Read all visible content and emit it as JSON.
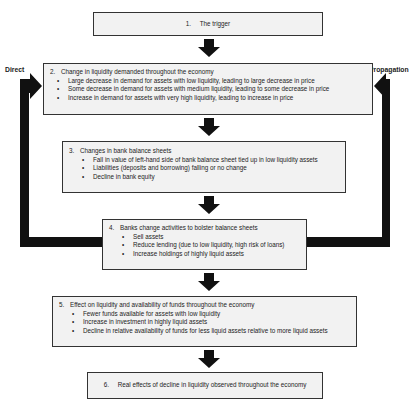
{
  "diagram": {
    "type": "flowchart",
    "side_labels": {
      "left": "Direct",
      "right": "Propagation"
    },
    "steps": [
      {
        "number": "1.",
        "title": "The trigger",
        "bullets": []
      },
      {
        "number": "2.",
        "title": "Change in liquidity demanded throughout the economy",
        "bullets": [
          "Large decrease in demand for assets with low liquidity, leading to large decrease in price",
          "Some decrease in demand for assets with medium liquidity, leading to some decrease in price",
          "Increase in demand for assets with very high liquidity, leading to increase in price"
        ]
      },
      {
        "number": "3.",
        "title": "Changes in bank balance sheets",
        "bullets": [
          "Fall in value of left-hand side of bank balance sheet tied up in low liquidity assets",
          "Liabilities (deposits and borrowing) falling or no change",
          "Decline in bank equity"
        ]
      },
      {
        "number": "4.",
        "title": "Banks change activities to bolster balance sheets",
        "bullets": [
          "Sell assets",
          "Reduce lending (due to low liquidity, high risk of loans)",
          "Increase holdings of highly liquid assets"
        ]
      },
      {
        "number": "5.",
        "title": "Effect on liquidity and availability of funds throughout the economy",
        "bullets": [
          "Fewer funds available for assets with low liquidity",
          "Increase in investment in highly liquid assets",
          "Decline in relative availability of funds for less liquid assets relative to more liquid assets"
        ]
      },
      {
        "number": "6.",
        "title": "Real effects of decline in liquidity observed throughout the economy",
        "bullets": []
      }
    ],
    "colors": {
      "box_fill": "#f2f2f2",
      "box_border": "#333333",
      "arrow": "#111111"
    }
  }
}
